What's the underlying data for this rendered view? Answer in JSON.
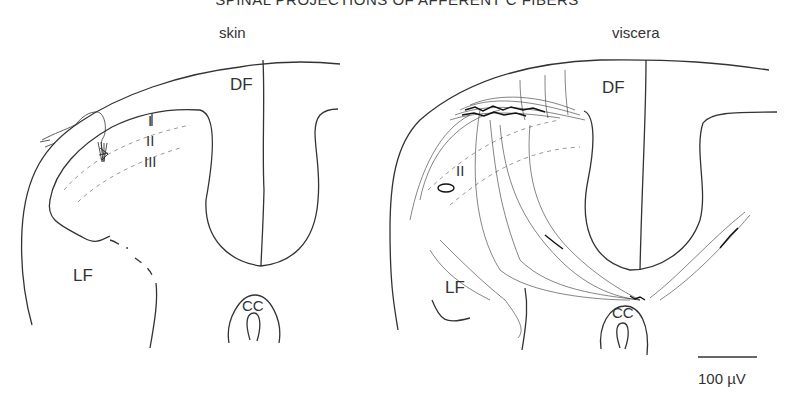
{
  "title": "SPINAL PROJECTIONS OF AFFERENT C FIBERS",
  "panels": [
    {
      "label": "skin",
      "regions": {
        "df": "DF",
        "lf": "LF",
        "cc": "CC"
      },
      "laminae": [
        "I",
        "II",
        "III"
      ]
    },
    {
      "label": "viscera",
      "regions": {
        "df": "DF",
        "lf": "LF",
        "cc": "CC"
      },
      "laminae": [
        "II"
      ]
    }
  ],
  "scale_bar": {
    "label": "100 µV"
  },
  "colors": {
    "line": "#333333",
    "dashed": "#999999"
  }
}
